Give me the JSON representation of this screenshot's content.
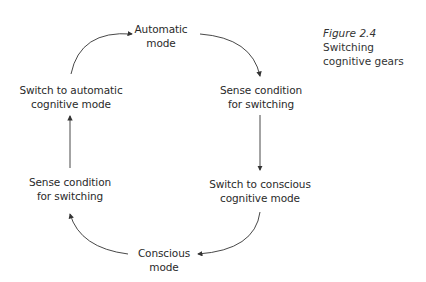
{
  "caption": {
    "figure_number": "Figure 2.4",
    "title_line1": "Switching",
    "title_line2": "cognitive gears"
  },
  "nodes": {
    "automatic_mode": {
      "line1": "Automatic",
      "line2": "mode"
    },
    "sense_right": {
      "line1": "Sense condition",
      "line2": "for switching"
    },
    "switch_conscious": {
      "line1": "Switch to conscious",
      "line2": "cognitive mode"
    },
    "conscious_mode": {
      "line1": "Conscious",
      "line2": "mode"
    },
    "sense_left": {
      "line1": "Sense condition",
      "line2": "for switching"
    },
    "switch_automatic": {
      "line1": "Switch to automatic",
      "line2": "cognitive mode"
    }
  },
  "colors": {
    "line": "#333333",
    "text": "#2a2a2a",
    "background": "#ffffff"
  }
}
